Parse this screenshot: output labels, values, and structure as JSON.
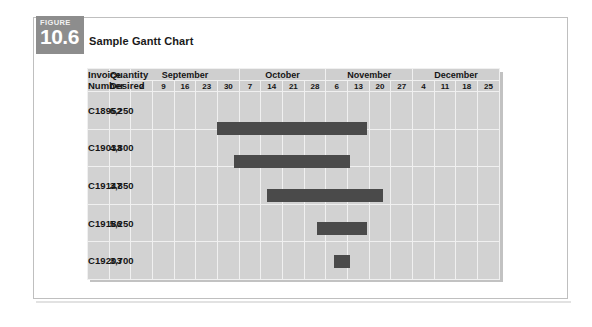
{
  "figure": {
    "badge_word": "FIGURE",
    "badge_number": "10.6",
    "title": "Sample Gantt Chart"
  },
  "table": {
    "col_headers": {
      "invoice": "Invoice\nNumber",
      "invoice_line1": "Invoice",
      "invoice_line2": "Number",
      "quantity_line1": "Quantity",
      "quantity_line2": "Desired"
    },
    "months": [
      {
        "name": "September",
        "days": [
          "2",
          "9",
          "16",
          "23",
          "30"
        ]
      },
      {
        "name": "October",
        "days": [
          "7",
          "14",
          "21",
          "28"
        ]
      },
      {
        "name": "November",
        "days": [
          "6",
          "13",
          "20",
          "27"
        ]
      },
      {
        "name": "December",
        "days": [
          "4",
          "11",
          "18",
          "25"
        ]
      }
    ],
    "rows": [
      {
        "invoice": "C18952",
        "quantity": "6,250"
      },
      {
        "invoice": "C19033",
        "quantity": "4,800"
      },
      {
        "invoice": "C19147",
        "quantity": "3,850"
      },
      {
        "invoice": "C19186",
        "quantity": "5,250"
      },
      {
        "invoice": "C19203",
        "quantity": "3,700"
      }
    ]
  },
  "chart_data": {
    "type": "bar",
    "title": "Sample Gantt Chart",
    "xlabel": "",
    "ylabel": "",
    "grid": true,
    "orientation": "horizontal-gantt",
    "x_tick_labels": [
      "2",
      "9",
      "16",
      "23",
      "30",
      "7",
      "14",
      "21",
      "28",
      "6",
      "13",
      "20",
      "27",
      "4",
      "11",
      "18",
      "25"
    ],
    "x_group_labels": [
      "September",
      "October",
      "November",
      "December"
    ],
    "x_group_spans": [
      5,
      4,
      4,
      4
    ],
    "categories": [
      "C18952",
      "C19033",
      "C19147",
      "C19186",
      "C19203"
    ],
    "bar_color": "#4a4a4a",
    "series": [
      {
        "name": "Scheduled production span",
        "bars": [
          {
            "row": "C18952",
            "quantity": 6250,
            "start_col": 0,
            "end_col": 8,
            "start_label": "2",
            "end_label": "28",
            "start_month": "September",
            "end_month": "October",
            "span_columns": 9
          },
          {
            "row": "C19033",
            "quantity": 4800,
            "start_col": 1,
            "end_col": 7,
            "start_label": "9",
            "end_label": "21",
            "start_month": "September",
            "end_month": "October",
            "span_columns": 7
          },
          {
            "row": "C19147",
            "quantity": 3850,
            "start_col": 3,
            "end_col": 9,
            "start_label": "23",
            "end_label": "6",
            "start_month": "September",
            "end_month": "November",
            "span_columns": 7
          },
          {
            "row": "C19186",
            "quantity": 5250,
            "start_col": 6,
            "end_col": 8,
            "start_label": "14",
            "end_label": "28",
            "start_month": "October",
            "end_month": "October",
            "span_columns": 3
          },
          {
            "row": "C19203",
            "quantity": 3700,
            "start_col": 7,
            "end_col": 7,
            "start_label": "21",
            "end_label": "21",
            "start_month": "October",
            "end_month": "October",
            "span_columns": 1
          }
        ]
      }
    ]
  }
}
